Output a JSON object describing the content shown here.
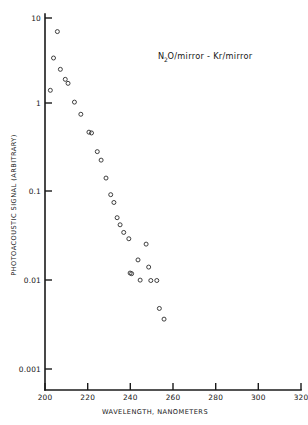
{
  "chart_data": {
    "type": "scatter",
    "title": "",
    "annotation": "N2O/mirror - Kr/mirror",
    "annotation_parts": {
      "pre": "N",
      "sub": "2",
      "post": "O/mirror  -  Kr/mirror"
    },
    "xlabel": "WAVELENGTH, NANOMETERS",
    "ylabel": "PHOTOACOUSTIC SIGNAL (ARBITRARY)",
    "xscale": "linear",
    "yscale": "log",
    "xlim": [
      200,
      320
    ],
    "ylim": [
      0.001,
      10
    ],
    "xticks": [
      200,
      220,
      240,
      260,
      280,
      300,
      320
    ],
    "xticklabels": [
      "200",
      "220",
      "240",
      "260",
      "280",
      "300",
      "320"
    ],
    "yticks": [
      0.001,
      0.01,
      0.1,
      1,
      10
    ],
    "yticklabels": [
      "0.001",
      "0.01",
      "0.1",
      "1",
      "10"
    ],
    "grid": false,
    "legend": null,
    "marker": "open-circle",
    "series": [
      {
        "name": "N2O/mirror - Kr/mirror",
        "x": [
          202.5,
          204.0,
          205.8,
          207.2,
          209.5,
          210.8,
          213.8,
          216.8,
          220.6,
          221.8,
          224.5,
          226.3,
          228.6,
          230.8,
          232.3,
          233.8,
          235.2,
          236.9,
          239.3,
          239.9,
          240.6,
          243.6,
          244.6,
          247.4,
          248.6,
          249.6,
          252.4,
          253.6,
          255.8
        ],
        "y": [
          1.5,
          3.5,
          7.0,
          2.6,
          2.0,
          1.8,
          1.1,
          0.8,
          0.5,
          0.49,
          0.3,
          0.24,
          0.15,
          0.097,
          0.079,
          0.053,
          0.044,
          0.036,
          0.0305,
          0.0124,
          0.0122,
          0.0175,
          0.0103,
          0.0265,
          0.0145,
          0.0102,
          0.0102,
          0.0049,
          0.0037
        ]
      }
    ]
  },
  "axes": {
    "x_axis_name": "wavelength-axis",
    "y_axis_name": "signal-axis"
  }
}
